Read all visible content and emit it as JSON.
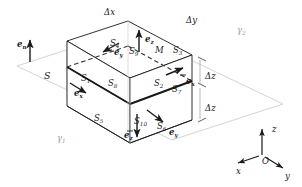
{
  "figure": {
    "colors": {
      "ink": "#1a1a1a",
      "faint": "#bdbdbd",
      "plane": "#c9c9c9",
      "hidden": "#555555",
      "background": "#ffffff"
    },
    "surface_labels": [
      {
        "id": "S1",
        "base": "S",
        "sub": "1",
        "x": 81,
        "y": 74
      },
      {
        "id": "S2",
        "base": "S",
        "sub": "2",
        "x": 154,
        "y": 79
      },
      {
        "id": "S3",
        "base": "S",
        "sub": "3",
        "x": 173,
        "y": 46
      },
      {
        "id": "S4",
        "base": "S",
        "sub": "4",
        "x": 110,
        "y": 39
      },
      {
        "id": "S5",
        "base": "S",
        "sub": "5",
        "x": 94,
        "y": 114
      },
      {
        "id": "S6",
        "base": "S",
        "sub": "6",
        "x": 157,
        "y": 122
      },
      {
        "id": "S7",
        "base": "S",
        "sub": "7",
        "x": 172,
        "y": 85
      },
      {
        "id": "S8",
        "base": "S",
        "sub": "8",
        "x": 108,
        "y": 79
      },
      {
        "id": "S9",
        "base": "S",
        "sub": "9",
        "x": 129,
        "y": 47
      },
      {
        "id": "S10",
        "base": "S",
        "sub": "10",
        "x": 134,
        "y": 117
      }
    ],
    "interface_label": {
      "id": "S",
      "text": "S",
      "x": 44,
      "y": 71
    },
    "point_label": {
      "id": "M",
      "text": "M",
      "x": 155,
      "y": 46
    },
    "region_labels": [
      {
        "id": "gamma1",
        "base": "γ",
        "sub": "1",
        "x": 57,
        "y": 134
      },
      {
        "id": "gamma2",
        "base": "γ",
        "sub": "2",
        "x": 237,
        "y": 26
      }
    ],
    "dimension_labels": [
      {
        "id": "dx",
        "text": "Δx",
        "x": 104,
        "y": 8
      },
      {
        "id": "dy",
        "text": "Δy",
        "x": 186,
        "y": 16
      },
      {
        "id": "dz1",
        "text": "Δz",
        "x": 205,
        "y": 72
      },
      {
        "id": "dz2",
        "text": "Δz",
        "x": 205,
        "y": 104
      }
    ],
    "vector_labels": [
      {
        "id": "en",
        "base": "e",
        "sub": "n",
        "sub_style": "upright",
        "x": 17,
        "y": 40
      },
      {
        "id": "ez-top",
        "base": "e",
        "sub": "z",
        "sub_style": "italic",
        "x": 145,
        "y": 35
      },
      {
        "id": "ey-top",
        "base": "e",
        "sub": "y",
        "sub_style": "italic",
        "x": 114,
        "y": 48
      },
      {
        "id": "ex-left",
        "base": "e",
        "sub": "x",
        "sub_style": "italic",
        "x": 74,
        "y": 89
      },
      {
        "id": "ex-right",
        "base": "e",
        "sub": "x",
        "sub_style": "italic",
        "x": 186,
        "y": 77
      },
      {
        "id": "ey-bottom",
        "base": "e",
        "sub": "y",
        "sub_style": "italic",
        "x": 169,
        "y": 128
      },
      {
        "id": "ez-bottom",
        "base": "e",
        "sub": "z",
        "sub_style": "italic",
        "x": 124,
        "y": 131
      }
    ],
    "axes": {
      "origin_label": "O",
      "origin_x": 262,
      "origin_y": 157,
      "items": [
        {
          "id": "axis-z",
          "text": "z",
          "x": 272,
          "y": 125
        },
        {
          "id": "axis-x",
          "text": "x",
          "x": 236,
          "y": 167
        },
        {
          "id": "axis-y",
          "text": "y",
          "x": 285,
          "y": 172
        }
      ]
    }
  }
}
